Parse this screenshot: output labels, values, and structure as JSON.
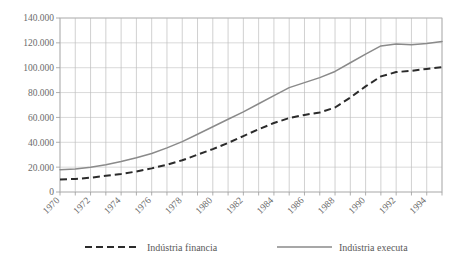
{
  "chart_data": {
    "type": "line",
    "title": "",
    "xlabel": "",
    "ylabel": "",
    "x": [
      1970,
      1971,
      1972,
      1973,
      1974,
      1975,
      1976,
      1977,
      1978,
      1979,
      1980,
      1981,
      1982,
      1983,
      1984,
      1985,
      1986,
      1987,
      1988,
      1989,
      1990,
      1991,
      1992,
      1993,
      1994,
      1995
    ],
    "xlim": [
      1970,
      1995
    ],
    "ylim": [
      0,
      140000
    ],
    "ytick_values": [
      0,
      20000,
      40000,
      60000,
      80000,
      100000,
      120000,
      140000
    ],
    "ytick_labels": [
      "0",
      "20.000",
      "40.000",
      "60.000",
      "80.000",
      "100.000",
      "120.000",
      "140.000"
    ],
    "xtick_labels": [
      "1970",
      "1972",
      "1974",
      "1976",
      "1978",
      "1980",
      "1982",
      "1984",
      "1986",
      "1988",
      "1990",
      "1992",
      "1994"
    ],
    "xtick_values": [
      1970,
      1972,
      1974,
      1976,
      1978,
      1980,
      1982,
      1984,
      1986,
      1988,
      1990,
      1992,
      1994
    ],
    "xtick_rotation": 45,
    "grid": true,
    "legend_position": "bottom",
    "series": [
      {
        "name": "Indústria financia",
        "style": "dashed",
        "color": "#2b2b2b",
        "values": [
          10000,
          10500,
          11500,
          13000,
          14500,
          16500,
          19000,
          22000,
          25500,
          30000,
          34500,
          39500,
          45000,
          50500,
          55500,
          59500,
          62000,
          64000,
          68000,
          76000,
          85000,
          93000,
          96500,
          97500,
          99000,
          100500
        ]
      },
      {
        "name": "Indústria executa",
        "style": "solid",
        "color": "#8a8a8a",
        "values": [
          18000,
          18500,
          20000,
          22000,
          24500,
          27500,
          31000,
          35500,
          40500,
          46500,
          52500,
          58500,
          64500,
          71000,
          77500,
          84000,
          88000,
          92000,
          97000,
          104000,
          111000,
          117500,
          119000,
          118500,
          119500,
          121000
        ]
      }
    ]
  },
  "legend": {
    "items": [
      {
        "label": "Indústria financia",
        "marker": "dashed-line"
      },
      {
        "label": "Indústria executa",
        "marker": "solid-line"
      }
    ]
  },
  "colors": {
    "series_dashed": "#2b2b2b",
    "series_solid": "#8a8a8a",
    "grid": "#c9c9c9",
    "frame": "#b0b0b0",
    "text": "#5a5a5a",
    "background": "#ffffff"
  }
}
